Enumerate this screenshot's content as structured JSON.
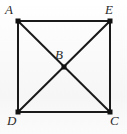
{
  "figure": {
    "kind": "geometry-diagram",
    "background_color": "#fbfbfb",
    "stroke_color": "#1a1a1a",
    "label_color": "#2b2b2b",
    "stroke_width": 2,
    "vertex_marker": "filled-square",
    "vertex_marker_size": 5,
    "points": [
      {
        "id": "A",
        "label": "A",
        "x": 18,
        "y": 21,
        "label_x": 5,
        "label_y": 3
      },
      {
        "id": "E",
        "label": "E",
        "x": 110,
        "y": 21,
        "label_x": 105,
        "label_y": 3
      },
      {
        "id": "C",
        "label": "C",
        "x": 110,
        "y": 112,
        "label_x": 110,
        "label_y": 114
      },
      {
        "id": "D",
        "label": "D",
        "x": 18,
        "y": 112,
        "label_x": 7,
        "label_y": 114
      },
      {
        "id": "B",
        "label": "B",
        "x": 64,
        "y": 67,
        "label_x": 55,
        "label_y": 48
      }
    ],
    "segments": [
      {
        "from": "A",
        "to": "E",
        "role": "top-side"
      },
      {
        "from": "E",
        "to": "C",
        "role": "right-side"
      },
      {
        "from": "C",
        "to": "D",
        "role": "bottom-side"
      },
      {
        "from": "D",
        "to": "A",
        "role": "left-side"
      },
      {
        "from": "A",
        "to": "C",
        "role": "diagonal"
      },
      {
        "from": "E",
        "to": "D",
        "role": "diagonal"
      }
    ]
  }
}
